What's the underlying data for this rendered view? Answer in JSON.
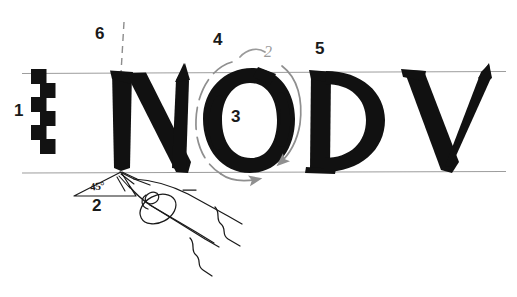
{
  "figure": {
    "background_color": "#ffffff",
    "ink_color": "#111111",
    "guideline_color": "#9a9a9a",
    "arrow_color": "#8f8f8f",
    "letters": [
      {
        "glyph": "N",
        "name": "letter-n"
      },
      {
        "glyph": "O",
        "name": "letter-o"
      },
      {
        "glyph": "D",
        "name": "letter-d"
      },
      {
        "glyph": "V",
        "name": "letter-v"
      }
    ],
    "word": "NODV"
  },
  "guidelines": {
    "cap_line_label": "cap-height-line",
    "base_line_label": "baseline",
    "vertical_dashed_label": "vertical-stem-guide"
  },
  "annotations": {
    "nib_ladder": {
      "number": "1",
      "name": "nib-width-ladder",
      "steps": 6
    },
    "pen_angle": {
      "number": "2",
      "value": "45°",
      "name": "pen-angle-indicator"
    },
    "counter": {
      "number": "3",
      "name": "o-counter-marker"
    },
    "left_stroke": {
      "number": "4",
      "name": "o-left-stroke-marker"
    },
    "d_stem": {
      "number": "5",
      "name": "d-stem-marker"
    },
    "n_stem": {
      "number": "6",
      "name": "n-stem-marker"
    },
    "top_arc": {
      "number": "2",
      "name": "o-top-arc-marker"
    }
  },
  "pen": {
    "name": "broad-edge-pen-nib",
    "parts": [
      "nib-tip",
      "breather-hole",
      "slit",
      "shoulders",
      "body"
    ]
  }
}
